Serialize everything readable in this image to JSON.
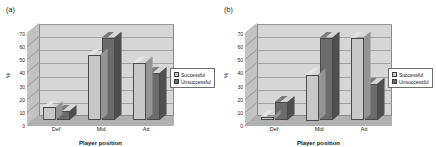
{
  "figure": {
    "panels": [
      {
        "label": "(a)",
        "chart_index": 0
      },
      {
        "label": "(b)",
        "chart_index": 1
      }
    ]
  },
  "chart_data": [
    {
      "type": "bar",
      "panel": "(a)",
      "title": "",
      "xlabel": "Player position",
      "ylabel": "%",
      "categories": [
        "Def",
        "Mid",
        "Att"
      ],
      "series": [
        {
          "name": "Successful",
          "values": [
            10,
            50,
            44
          ],
          "color": "#c8c8c8"
        },
        {
          "name": "Unsuccessful",
          "values": [
            7,
            63,
            36
          ],
          "color": "#6b6b6b"
        }
      ],
      "ylim": [
        0,
        70
      ],
      "yticks": [
        0,
        10,
        20,
        30,
        40,
        50,
        60,
        70
      ],
      "grid": true,
      "legend_position": "right",
      "three_d": true
    },
    {
      "type": "bar",
      "panel": "(b)",
      "title": "",
      "xlabel": "Player position",
      "ylabel": "%",
      "categories": [
        "Def",
        "Mid",
        "Att"
      ],
      "series": [
        {
          "name": "Successful",
          "values": [
            3,
            35,
            63
          ],
          "color": "#c8c8c8"
        },
        {
          "name": "Unsuccessful",
          "values": [
            14,
            63,
            28
          ],
          "color": "#6b6b6b"
        }
      ],
      "ylim": [
        0,
        70
      ],
      "yticks": [
        0,
        10,
        20,
        30,
        40,
        50,
        60,
        70
      ],
      "grid": true,
      "legend_position": "right",
      "three_d": true
    }
  ],
  "colors": {
    "successful": "#c8c8c8",
    "unsuccessful": "#6b6b6b",
    "wall": "#d6d6d6",
    "floor": "#b5b5b5",
    "background": "#ffffff"
  }
}
